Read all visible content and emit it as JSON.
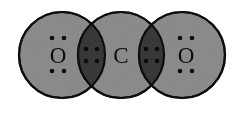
{
  "diagram": {
    "type": "overlapping-circles-lewis-structure",
    "molecule": "CO2",
    "canvas": {
      "width": 242,
      "height": 114,
      "background": "#ffffff"
    },
    "colors": {
      "circle_fill": "#8d8d8d",
      "overlap_fill": "#3a3a3a",
      "outline": "#101010",
      "symbol": "#0d0d0d",
      "dot": "#0d0d0d",
      "overlap_dot": "#0d0d0d"
    },
    "geometry": {
      "radius": 43,
      "center_y": 55,
      "stroke_width": 2.2
    },
    "atoms": [
      {
        "id": "oxygen-left",
        "symbol": "O",
        "element": "oxygen",
        "cx": 62,
        "cy": 55,
        "label_dx": -4,
        "lone_pairs": [
          {
            "position": "above",
            "dots": 2
          },
          {
            "position": "below",
            "dots": 2
          }
        ],
        "lone_pair_dot_count": 4
      },
      {
        "id": "carbon-center",
        "symbol": "C",
        "element": "carbon",
        "cx": 121,
        "cy": 55,
        "label_dx": 0,
        "lone_pairs": [],
        "lone_pair_dot_count": 0
      },
      {
        "id": "oxygen-right",
        "symbol": "O",
        "element": "oxygen",
        "cx": 182,
        "cy": 55,
        "label_dx": 4,
        "lone_pairs": [
          {
            "position": "above",
            "dots": 2
          },
          {
            "position": "below",
            "dots": 2
          }
        ],
        "lone_pair_dot_count": 4
      }
    ],
    "bonds": [
      {
        "id": "bond-left",
        "between": [
          "oxygen-left",
          "carbon-center"
        ],
        "bond_order": 2,
        "shared_electrons": 4,
        "cx": 91.5,
        "cy": 55,
        "dot_grid": {
          "rows": 2,
          "cols": 2,
          "spacing_x": 11,
          "spacing_y": 12
        }
      },
      {
        "id": "bond-right",
        "between": [
          "carbon-center",
          "oxygen-right"
        ],
        "bond_order": 2,
        "shared_electrons": 4,
        "cx": 151.5,
        "cy": 55,
        "dot_grid": {
          "rows": 2,
          "cols": 2,
          "spacing_x": 11,
          "spacing_y": 12
        }
      }
    ],
    "dot_radius": 2.3,
    "symbol_font_size": 23
  }
}
